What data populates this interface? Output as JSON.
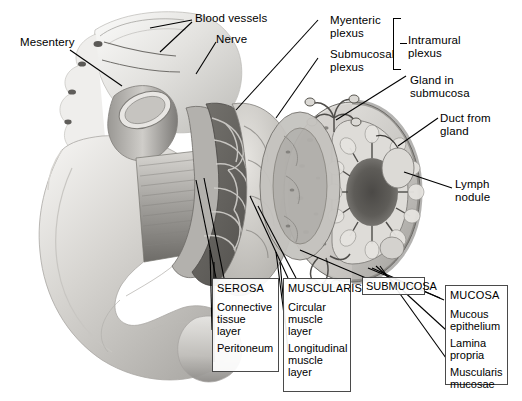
{
  "figure": {
    "style": "grayscale anatomical illustration",
    "watermark_text": "",
    "background_color": "#ffffff",
    "line_color": "#000000",
    "box_border_color": "#4a4a4a"
  },
  "callouts": [
    {
      "name": "mesentery",
      "text": "Mesentery"
    },
    {
      "name": "blood-vessels",
      "text": "Blood vessels"
    },
    {
      "name": "nerve",
      "text": "Nerve"
    },
    {
      "name": "myenteric-plexus",
      "text": "Myenteric\nplexus"
    },
    {
      "name": "submucosal-plexus",
      "text": "Submucosal\nplexus"
    },
    {
      "name": "intramural-plexus",
      "text": "Intramural\nplexus"
    },
    {
      "name": "gland-in-submucosa",
      "text": "Gland in\nsubmucosa"
    },
    {
      "name": "duct-from-gland",
      "text": "Duct from\ngland"
    },
    {
      "name": "lymph-nodule",
      "text": "Lymph\nnodule"
    }
  ],
  "layer_boxes": [
    {
      "name": "serosa",
      "heading": "SEROSA",
      "items": [
        "Connective\ntissue\nlayer",
        "Peritoneum"
      ]
    },
    {
      "name": "muscularis",
      "heading": "MUSCULARIS",
      "items": [
        "Circular\nmuscle\nlayer",
        "Longitudinal\nmuscle\nlayer"
      ]
    },
    {
      "name": "submucosa",
      "heading": "SUBMUCOSA",
      "items": []
    },
    {
      "name": "mucosa",
      "heading": "MUCOSA",
      "items": [
        "Mucous\nepithelium",
        "Lamina\npropria",
        "Muscularis\nmucosae"
      ]
    }
  ]
}
